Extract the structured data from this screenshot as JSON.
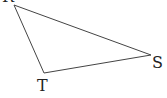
{
  "diagram": {
    "type": "triangle",
    "vertices": [
      {
        "label": "R",
        "x": 14,
        "y": 5,
        "label_x": 2,
        "label_y": 2
      },
      {
        "label": "T",
        "x": 44,
        "y": 73,
        "label_x": 37,
        "label_y": 91
      },
      {
        "label": "S",
        "x": 151,
        "y": 55,
        "label_x": 152,
        "label_y": 68
      }
    ],
    "stroke_color": "#444444"
  }
}
